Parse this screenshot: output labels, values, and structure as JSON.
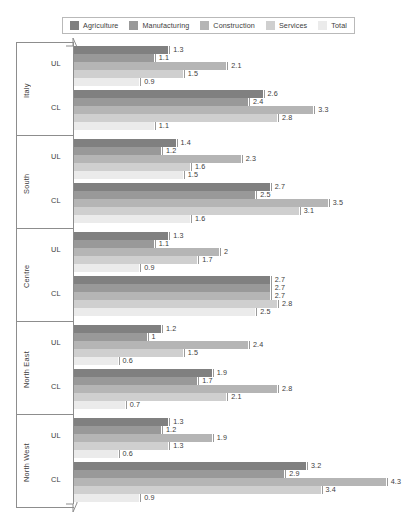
{
  "legend": {
    "items": [
      {
        "label": "Agriculture",
        "color": "#808080"
      },
      {
        "label": "Manufacturing",
        "color": "#999999"
      },
      {
        "label": "Construction",
        "color": "#b5b5b5"
      },
      {
        "label": "Services",
        "color": "#cfcfcf"
      },
      {
        "label": "Total",
        "color": "#ebebeb"
      }
    ]
  },
  "chart_data": {
    "type": "bar",
    "orientation": "horizontal",
    "title": "",
    "xlabel": "",
    "ylabel": "",
    "xlim": [
      0,
      4.6
    ],
    "grid": false,
    "legend_position": "top-center",
    "axis_break": true,
    "categories": [
      "Italy",
      "South",
      "Centre",
      "North East",
      "North West"
    ],
    "subcategories": [
      "UL",
      "CL"
    ],
    "series": [
      {
        "name": "Agriculture",
        "color": "#808080"
      },
      {
        "name": "Manufacturing",
        "color": "#999999"
      },
      {
        "name": "Construction",
        "color": "#b5b5b5"
      },
      {
        "name": "Services",
        "color": "#cfcfcf"
      },
      {
        "name": "Total",
        "color": "#ebebeb"
      }
    ],
    "groups": [
      {
        "region": "Italy",
        "clusters": [
          {
            "label": "UL",
            "values": [
              1.3,
              1.1,
              2.1,
              1.5,
              0.9
            ],
            "labels": [
              "1.3",
              "1.1",
              "2.1",
              "1.5",
              "0.9"
            ]
          },
          {
            "label": "CL",
            "values": [
              2.6,
              2.4,
              3.3,
              2.8,
              1.1
            ],
            "labels": [
              "2.6",
              "2.4",
              "3.3",
              "2.8",
              "1.1"
            ]
          }
        ]
      },
      {
        "region": "South",
        "clusters": [
          {
            "label": "UL",
            "values": [
              1.4,
              1.2,
              2.3,
              1.6,
              1.5
            ],
            "labels": [
              "1.4",
              "1.2",
              "2.3",
              "1.6",
              "1.5"
            ]
          },
          {
            "label": "CL",
            "values": [
              2.7,
              2.5,
              3.5,
              3.1,
              1.6
            ],
            "labels": [
              "2.7",
              "2.5",
              "3.5",
              "3.1",
              "1.6"
            ]
          }
        ]
      },
      {
        "region": "Centre",
        "clusters": [
          {
            "label": "UL",
            "values": [
              1.3,
              1.1,
              2.0,
              1.7,
              0.9
            ],
            "labels": [
              "1.3",
              "1.1",
              "2",
              "1.7",
              "0.9"
            ]
          },
          {
            "label": "CL",
            "values": [
              2.7,
              2.7,
              2.7,
              2.8,
              2.5
            ],
            "labels": [
              "2.7",
              "2.7",
              "2.7",
              "2.8",
              "2.5"
            ]
          }
        ]
      },
      {
        "region": "North East",
        "clusters": [
          {
            "label": "UL",
            "values": [
              1.2,
              1.0,
              2.4,
              1.5,
              0.6
            ],
            "labels": [
              "1.2",
              "1",
              "2.4",
              "1.5",
              "0.6"
            ]
          },
          {
            "label": "CL",
            "values": [
              1.9,
              1.7,
              2.8,
              2.1,
              0.7
            ],
            "labels": [
              "1.9",
              "1.7",
              "2.8",
              "2.1",
              "0.7"
            ]
          }
        ]
      },
      {
        "region": "North West",
        "clusters": [
          {
            "label": "UL",
            "values": [
              1.3,
              1.2,
              1.9,
              1.3,
              0.6
            ],
            "labels": [
              "1.3",
              "1.2",
              "1.9",
              "1.3",
              "0.6"
            ]
          },
          {
            "label": "CL",
            "values": [
              3.2,
              2.9,
              4.3,
              3.4,
              0.9
            ],
            "labels": [
              "3.2",
              "2.9",
              "4.3",
              "3.4",
              "0.9"
            ]
          }
        ]
      }
    ]
  }
}
